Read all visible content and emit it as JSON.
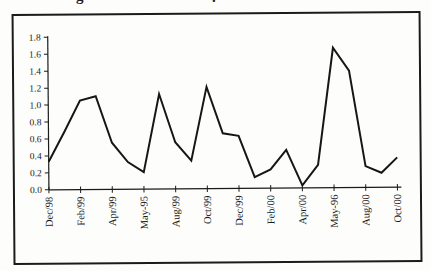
{
  "figure": {
    "background": "#fdfdfb",
    "ink_color": "#1b1b1b",
    "cropped_caption_fragments": [
      "g",
      "."
    ]
  },
  "chart_data": {
    "type": "line",
    "title": "",
    "xlabel": "",
    "ylabel": "",
    "categories": [
      "Dec/98",
      "Jan/99",
      "Feb/99",
      "Mar/99",
      "Apr/99",
      "May/99",
      "Jun/99",
      "Jul/99",
      "Aug/99",
      "Sep/99",
      "Oct/99",
      "Nov/99",
      "Dec/99",
      "Jan/00",
      "Feb/00",
      "Mar/00",
      "Apr/00",
      "May/00",
      "Jun/00",
      "Jul/00",
      "Aug/00",
      "Sep/00",
      "Oct/00"
    ],
    "values": [
      0.33,
      0.68,
      1.05,
      1.1,
      0.55,
      0.32,
      0.2,
      1.12,
      0.55,
      0.33,
      1.2,
      0.65,
      0.62,
      0.13,
      0.22,
      0.45,
      0.03,
      0.27,
      1.65,
      1.38,
      0.25,
      0.17,
      0.35
    ],
    "x_tick_labels": [
      "Dec/98",
      "Feb/99",
      "Apr/99",
      "May-95",
      "Aug/99",
      "Oct/99",
      "Dec/99",
      "Feb/00",
      "Apr/00",
      "May-96",
      "Aug/00",
      "Oct/00"
    ],
    "x_label_every": 2,
    "ylim": [
      0.0,
      1.8
    ],
    "ytick_step": 0.2,
    "ytick_labels": [
      "0.0",
      "0.2",
      "0.4",
      "0.6",
      "0.8",
      "1.0",
      "1.2",
      "1.4",
      "1.6",
      "1.8"
    ],
    "grid": false,
    "legend": "none",
    "line_color": "#161616"
  }
}
